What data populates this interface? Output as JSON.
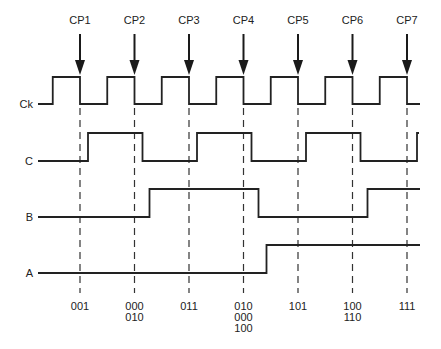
{
  "diagram": {
    "clock_pulses": [
      "CP1",
      "CP2",
      "CP3",
      "CP4",
      "CP5",
      "CP6",
      "CP7"
    ],
    "signals": [
      {
        "name": "Ck",
        "label": "Ck"
      },
      {
        "name": "C",
        "label": "C"
      },
      {
        "name": "B",
        "label": "B"
      },
      {
        "name": "A",
        "label": "A"
      }
    ],
    "waveforms": {
      "Ck": {
        "initial": 0,
        "transitions_at_half_periods": "clock: rises mid-period before each CP, falls at each CP"
      },
      "C": {
        "initial": 0,
        "transitions_after_cp": [
          1,
          2,
          3,
          4,
          5,
          6,
          7
        ]
      },
      "B": {
        "initial": 0,
        "transitions_after_cp": [
          2,
          4,
          6
        ]
      },
      "A": {
        "initial": 0,
        "transitions_after_cp": [
          4
        ]
      }
    },
    "state_labels": [
      [
        "001"
      ],
      [
        "000",
        "010"
      ],
      [
        "011"
      ],
      [
        "010",
        "000",
        "100"
      ],
      [
        "101"
      ],
      [
        "100",
        "110"
      ],
      [
        "111"
      ]
    ]
  }
}
